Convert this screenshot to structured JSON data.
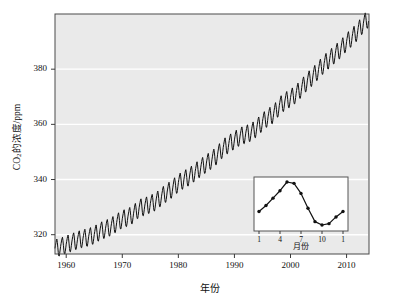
{
  "chart_data": {
    "type": "line",
    "title": "",
    "xlabel": "年份",
    "ylabel": "CO2的浓度/ppm",
    "ylabel_prefix": "CO",
    "ylabel_sub": "2",
    "ylabel_suffix": "的浓度/ppm",
    "xlim": [
      1958,
      2014
    ],
    "ylim": [
      313,
      400
    ],
    "xticks": [
      1960,
      1970,
      1980,
      1990,
      2000,
      2010
    ],
    "xtick_labels": [
      "1960",
      "1970",
      "1980",
      "1990",
      "2000",
      "2010"
    ],
    "yticks": [
      320,
      340,
      360,
      380
    ],
    "ytick_labels": [
      "320",
      "340",
      "360",
      "380"
    ],
    "grid": "horizontal-white",
    "legend": "none",
    "plot_bg": "#eaeaea",
    "line_color": "#111111",
    "series": [
      {
        "name": "CO2 annual mean trend (Mauna Loa)",
        "x": [
          1958,
          1959,
          1960,
          1961,
          1962,
          1963,
          1964,
          1965,
          1966,
          1967,
          1968,
          1969,
          1970,
          1971,
          1972,
          1973,
          1974,
          1975,
          1976,
          1977,
          1978,
          1979,
          1980,
          1981,
          1982,
          1983,
          1984,
          1985,
          1986,
          1987,
          1988,
          1989,
          1990,
          1991,
          1992,
          1993,
          1994,
          1995,
          1996,
          1997,
          1998,
          1999,
          2000,
          2001,
          2002,
          2003,
          2004,
          2005,
          2006,
          2007,
          2008,
          2009,
          2010,
          2011,
          2012,
          2013,
          2014
        ],
        "values": [
          315.0,
          315.6,
          316.4,
          317.2,
          318.0,
          318.6,
          319.1,
          319.9,
          321.2,
          322.0,
          322.9,
          324.3,
          325.6,
          326.3,
          327.4,
          329.6,
          330.2,
          331.1,
          332.0,
          333.8,
          335.3,
          336.8,
          338.7,
          340.0,
          341.1,
          342.7,
          344.3,
          345.8,
          347.2,
          349.0,
          351.4,
          352.9,
          354.2,
          355.6,
          356.4,
          357.1,
          358.8,
          360.8,
          362.6,
          363.7,
          366.6,
          368.3,
          369.5,
          371.0,
          373.2,
          375.6,
          377.4,
          379.7,
          381.9,
          383.7,
          385.6,
          387.4,
          389.8,
          391.6,
          393.8,
          396.5,
          398.6
        ]
      }
    ],
    "seasonal_amplitude_ppm": 3.2,
    "seasonal_note": "annual sawtooth oscillation superimposed on rising trend; peak in May, minimum in late September/October"
  },
  "inset": {
    "type": "line",
    "xlabel": "月份",
    "xticks": [
      1,
      4,
      7,
      10,
      13
    ],
    "xtick_labels": [
      "1",
      "4",
      "7",
      "10",
      "1"
    ],
    "bg": "#ffffff",
    "marker": "filled-circle",
    "line_color": "#111111",
    "months": [
      1,
      2,
      3,
      4,
      5,
      6,
      7,
      8,
      9,
      10,
      11,
      12,
      13
    ],
    "values": [
      1.0,
      1.45,
      2.0,
      2.55,
      3.2,
      3.1,
      2.35,
      1.25,
      0.25,
      0.0,
      0.1,
      0.6,
      1.0
    ],
    "values_note": "relative seasonal deviation of CO2 (ppm, arbitrary offset); peak around May, trough around October"
  }
}
